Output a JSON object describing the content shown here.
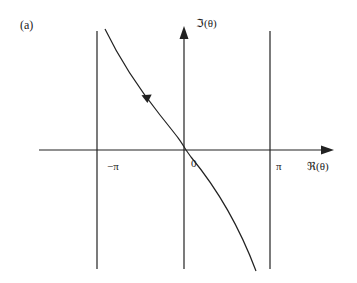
{
  "figure": {
    "panel_label": "(a)",
    "axes": {
      "x_label": "ℜ(θ)",
      "y_label": "ℑ(θ)"
    },
    "ticks": {
      "neg_pi": "−π",
      "zero": "0",
      "pi": "π"
    },
    "colors": {
      "ink": "#222222",
      "background": "#ffffff"
    }
  }
}
